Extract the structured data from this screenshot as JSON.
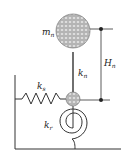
{
  "diagram": {
    "colors": {
      "line": "#333333",
      "mass_fill": "#b8b8b8",
      "mass_texture": "#e0e0e0",
      "background": "#ffffff"
    },
    "labels": {
      "mass": {
        "main": "m",
        "sub": "n"
      },
      "height": {
        "main": "H",
        "sub": "n"
      },
      "neck_stiffness": {
        "main": "k",
        "sub": "n"
      },
      "lateral_spring": {
        "main": "k",
        "sub": "s"
      },
      "rotational_spring": {
        "main": "k",
        "sub": "r"
      }
    }
  }
}
